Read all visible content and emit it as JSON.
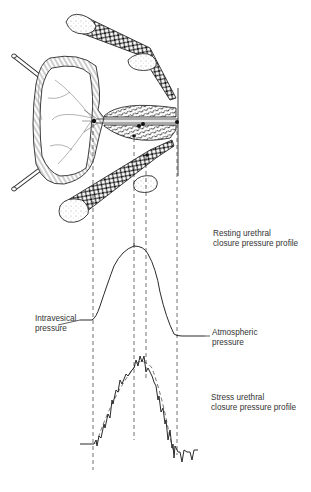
{
  "figure": {
    "type": "anatomical-diagram"
  },
  "labels": {
    "resting_profile": {
      "line1": "Resting urethral",
      "line2": "closure pressure profile"
    },
    "intravesical": {
      "line1": "Intravesical",
      "line2": "pressure"
    },
    "atmospheric": {
      "line1": "Atmospheric",
      "line2": "pressure"
    },
    "stress_profile": {
      "line1": "Stress urethral",
      "line2": "closure pressure profile"
    }
  },
  "colors": {
    "ink": "#2a2a2a",
    "background": "#ffffff"
  }
}
